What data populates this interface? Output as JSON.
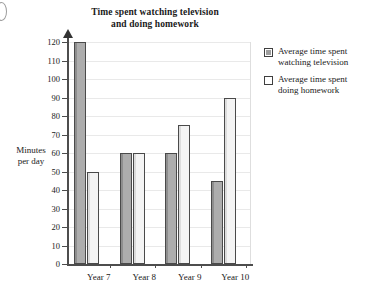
{
  "chart_data": {
    "type": "bar",
    "title": "Time spent watching television and doing homework",
    "title_lines": [
      "Time spent watching television",
      "and doing homework"
    ],
    "xlabel": "",
    "ylabel": "Minutes per day",
    "ylabel_lines": [
      "Minutes",
      "per day"
    ],
    "categories": [
      "Year 7",
      "Year 8",
      "Year 9",
      "Year 10"
    ],
    "series": [
      {
        "name": "Average time spent watching television",
        "name_lines": [
          "Average time spent",
          "watching television"
        ],
        "values": [
          120,
          60,
          60,
          45
        ],
        "color": "#a8a8a8"
      },
      {
        "name": "Average time spent doing homework",
        "name_lines": [
          "Average time spent",
          "doing homework"
        ],
        "values": [
          50,
          60,
          75,
          90
        ],
        "color": "#f2f2f2"
      }
    ],
    "ylim": [
      0,
      120
    ],
    "ytick_step": 10,
    "yticks": [
      0,
      10,
      20,
      30,
      40,
      50,
      60,
      70,
      80,
      90,
      100,
      110,
      120
    ],
    "grid": true,
    "grid_orientation": "horizontal",
    "legend_position": "right",
    "axis_color": "#4d4d4d",
    "grid_color": "#e9e9e9"
  }
}
